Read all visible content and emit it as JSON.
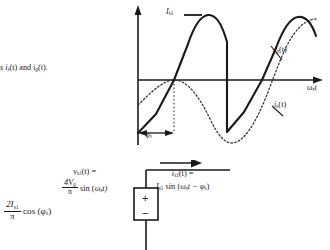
{
  "figure": {
    "caption_fragment": "s i",
    "caption_fragment_2": "(t) and i",
    "caption_fragment_3": "(t).",
    "caption_sub_1": "s",
    "caption_sub_2": "g"
  },
  "plot": {
    "amplitude_label": "I",
    "amplitude_label_sub": "s1",
    "curve_solid_label": "i",
    "curve_solid_label_sub": "g",
    "curve_solid_label_tail": "(t)",
    "curve_dotted_label": "i",
    "curve_dotted_label_sub": "s",
    "curve_dotted_label_tail": "(t)",
    "x_axis_label": "ω",
    "x_axis_label_sub": "s",
    "x_axis_label_tail": "t",
    "phase_marker": "φ",
    "phase_marker_sub": "s",
    "series": [
      {
        "name": "i_g(t)",
        "style": "solid",
        "description": "square-wave-derived current, sawtooth discontinuity at peak"
      },
      {
        "name": "i_s(t)",
        "style": "dotted",
        "description": "sinusoidal current lagging by phi_s"
      }
    ]
  },
  "circuit": {
    "source_plus": "+",
    "source_minus": "−",
    "voltage_label_line1_v": "v",
    "voltage_label_line1_sub": "s1",
    "voltage_label_line1_tail": "(t) =",
    "voltage_num": "4V",
    "voltage_num_sub": "g",
    "voltage_den": "π",
    "voltage_tail": "sin (ω",
    "voltage_tail_sub": "s",
    "voltage_tail_end": "t)",
    "current_label_line1_i": "i",
    "current_label_line1_sub": "s1",
    "current_label_line1_tail": "(t) =",
    "current_label_line2_I": "I",
    "current_label_line2_sub": "s1",
    "current_label_line2_tail": "sin (ω",
    "current_label_line2_sub2": "s",
    "current_label_line2_end": "t − φ",
    "current_label_line2_sub3": "s",
    "current_label_line2_close": ")"
  },
  "equation_left": {
    "num": "2I",
    "num_sub": "s1",
    "den": "π",
    "tail": "cos (φ",
    "tail_sub": "s",
    "tail_end": ")"
  },
  "colors": {
    "ink": "#1a1a1a",
    "background": "#ffffff",
    "dotted_curve": "#3a3a3a"
  }
}
